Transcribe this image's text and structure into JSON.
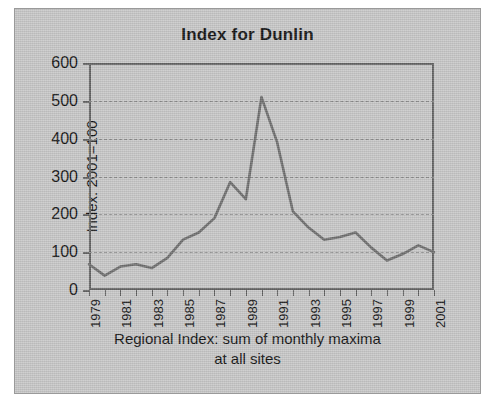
{
  "figure": {
    "background_color": "#c8c8c8",
    "line_color": "#6e6e6e",
    "axis_color": "#636363",
    "text_color": "#111111"
  },
  "chart_data": {
    "type": "line",
    "title": "Index for Dunlin",
    "xlabel": "Regional Index: sum of monthly maxima at all sites",
    "xlabel_line1": "Regional Index: sum of monthly maxima",
    "xlabel_line2": "at all sites",
    "ylabel": "Index: 2001=100",
    "ylim": [
      0,
      600
    ],
    "ytick_labels": [
      "600",
      "500",
      "400",
      "300",
      "200",
      "100",
      "0"
    ],
    "ytick_values": [
      600,
      500,
      400,
      300,
      200,
      100,
      0
    ],
    "xtick_labels": [
      "1979",
      "1981",
      "1983",
      "1985",
      "1987",
      "1989",
      "1991",
      "1993",
      "1995",
      "1997",
      "1999",
      "2001"
    ],
    "grid": true,
    "legend": false,
    "x": [
      1979,
      1980,
      1981,
      1982,
      1983,
      1984,
      1985,
      1986,
      1987,
      1988,
      1989,
      1990,
      1991,
      1992,
      1993,
      1994,
      1995,
      1996,
      1997,
      1998,
      1999,
      2000,
      2001
    ],
    "values": [
      68,
      38,
      62,
      68,
      58,
      85,
      133,
      152,
      190,
      285,
      240,
      510,
      390,
      208,
      165,
      133,
      140,
      152,
      112,
      78,
      95,
      118,
      100
    ],
    "series": [
      {
        "name": "Dunlin index",
        "values": [
          68,
          38,
          62,
          68,
          58,
          85,
          133,
          152,
          190,
          285,
          240,
          510,
          390,
          208,
          165,
          133,
          140,
          152,
          112,
          78,
          95,
          118,
          100
        ]
      }
    ]
  }
}
